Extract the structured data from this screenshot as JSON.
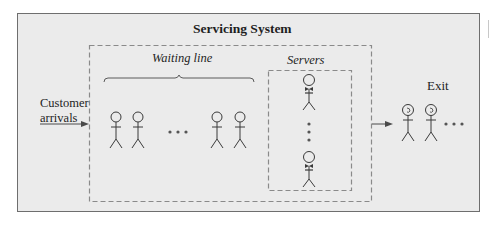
{
  "diagram": {
    "title": "Servicing System",
    "waiting_line_label": "Waiting line",
    "servers_label": "Servers",
    "arrivals_label_line1": "Customer",
    "arrivals_label_line2": "arrivals",
    "exit_label": "Exit",
    "waiting_customers_shown": 4,
    "servers_shown": 2,
    "exited_customers_shown": 2,
    "ellipsis": "• • •",
    "colors": {
      "panel_background": "#ebebeb",
      "panel_border": "#6e6e6e",
      "dashed_border": "#8a8a8a",
      "figure_stroke": "#3a3a3a",
      "text": "#1e1e1e"
    }
  }
}
